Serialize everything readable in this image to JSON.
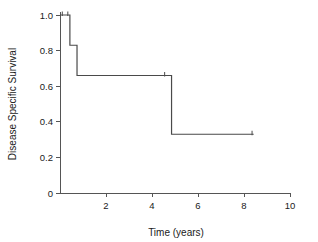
{
  "chart_data": {
    "type": "line",
    "subtype": "kaplan-meier-step",
    "title": "",
    "xlabel": "Time (years)",
    "ylabel": "Disease Specific Survival",
    "xlim": [
      0,
      10
    ],
    "ylim": [
      0,
      1.0
    ],
    "xticks": [
      0,
      2,
      4,
      6,
      8,
      10
    ],
    "xtick_labels": [
      "",
      "2",
      "4",
      "6",
      "8",
      "10"
    ],
    "yticks": [
      0,
      0.2,
      0.4,
      0.6,
      0.8,
      1.0
    ],
    "ytick_labels": [
      "0",
      "0.2",
      "0.4",
      "0.6",
      "0.8",
      "1.0"
    ],
    "grid": false,
    "legend": false,
    "series": [
      {
        "name": "Disease Specific Survival",
        "color": "#4a4a4a",
        "step_points": [
          {
            "x": 0.0,
            "y": 1.0
          },
          {
            "x": 0.43,
            "y": 1.0
          },
          {
            "x": 0.43,
            "y": 0.83
          },
          {
            "x": 0.74,
            "y": 0.83
          },
          {
            "x": 0.74,
            "y": 0.66
          },
          {
            "x": 4.85,
            "y": 0.66
          },
          {
            "x": 4.85,
            "y": 0.33
          },
          {
            "x": 8.42,
            "y": 0.33
          }
        ],
        "censor_marks": [
          {
            "x": 0.1,
            "y": 1.0
          },
          {
            "x": 0.34,
            "y": 1.0
          },
          {
            "x": 4.55,
            "y": 0.66
          },
          {
            "x": 8.35,
            "y": 0.33
          }
        ]
      }
    ]
  }
}
